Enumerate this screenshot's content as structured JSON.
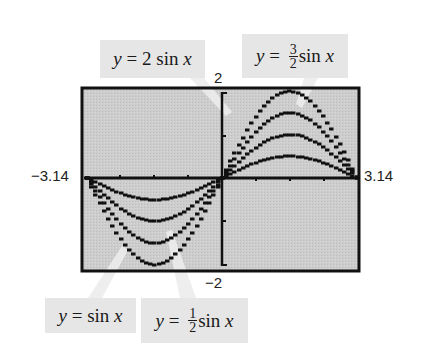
{
  "chart_data": {
    "type": "line",
    "title": "",
    "xlabel": "",
    "ylabel": "",
    "xlim": [
      -3.14,
      3.14
    ],
    "ylim": [
      -2,
      2
    ],
    "grid": false,
    "axis_labels": {
      "xmin": "−3.14",
      "xmax": "3.14",
      "ymax": "2",
      "ymin": "−2"
    },
    "x_ticks_step": 0.785,
    "y_ticks_step": 1,
    "series": [
      {
        "name": "y = 2 sin x",
        "amplitude": 2,
        "function": "2*sin(x)"
      },
      {
        "name": "y = 3/2 sin x",
        "amplitude": 1.5,
        "function": "1.5*sin(x)"
      },
      {
        "name": "y = sin x",
        "amplitude": 1,
        "function": "sin(x)"
      },
      {
        "name": "y = 1/2 sin x",
        "amplitude": 0.5,
        "function": "0.5*sin(x)"
      }
    ],
    "sample_points": {
      "x": [
        -3.14,
        -2.355,
        -1.57,
        -0.785,
        0,
        0.785,
        1.57,
        2.355,
        3.14
      ],
      "y_2sinx": [
        0,
        -1.41,
        -2,
        -1.41,
        0,
        1.41,
        2,
        1.41,
        0
      ],
      "y_1_5sinx": [
        0,
        -1.06,
        -1.5,
        -1.06,
        0,
        1.06,
        1.5,
        1.06,
        0
      ],
      "y_sinx": [
        0,
        -0.71,
        -1,
        -0.71,
        0,
        0.71,
        1,
        0.71,
        0
      ],
      "y_0_5sinx": [
        0,
        -0.35,
        -0.5,
        -0.35,
        0,
        0.35,
        0.5,
        0.35,
        0
      ]
    },
    "annotations": [
      {
        "text": "y = 2 sin x",
        "points_to": "2 sin x curve (upper right)"
      },
      {
        "text": "y = 3/2 sin x",
        "points_to": "3/2 sin x curve (upper right)"
      },
      {
        "text": "y = sin x",
        "points_to": "sin x curve (lower left)"
      },
      {
        "text": "y = 1/2 sin x",
        "points_to": "1/2 sin x curve (lower left)"
      }
    ],
    "colors": {
      "plot_background": "#cdcdcd",
      "frame": "#111111",
      "curves": "#111111",
      "label_background": "#e6e6e6",
      "callout": "#e8e8e8"
    }
  },
  "labels": {
    "two_sin": {
      "y": "y",
      "eq": " = 2 sin ",
      "x": "x"
    },
    "three_halves": {
      "y": "y",
      "eq": " = ",
      "num": "3",
      "den": "2",
      "fn": "sin ",
      "x": "x"
    },
    "sin": {
      "y": "y",
      "eq": " = sin ",
      "x": "x"
    },
    "half": {
      "y": "y",
      "eq": " = ",
      "num": "1",
      "den": "2",
      "fn": "sin ",
      "x": "x"
    }
  },
  "axis_text": {
    "xmin": "−3.14",
    "xmax": "3.14",
    "ymax": "2",
    "ymin": "−2"
  }
}
